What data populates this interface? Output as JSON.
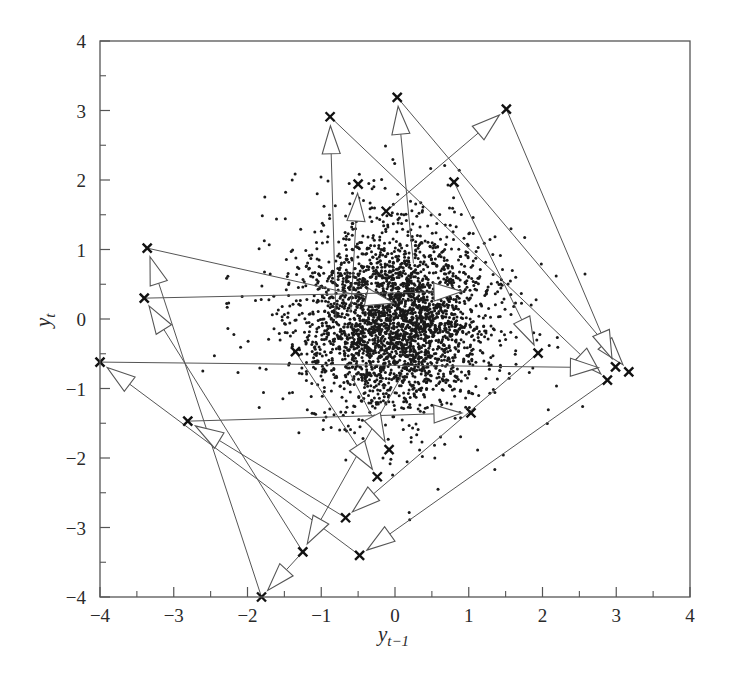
{
  "chart_data": {
    "type": "scatter",
    "title": "",
    "xlabel": "y_{t-1}",
    "ylabel": "y_t",
    "xlim": [
      -4,
      4
    ],
    "ylim": [
      -4,
      4
    ],
    "xticks": [
      -4,
      -3,
      -2,
      -1,
      0,
      1,
      2,
      3,
      4
    ],
    "yticks": [
      -4,
      -3,
      -2,
      -1,
      0,
      1,
      2,
      3,
      4
    ],
    "xtick_labels": [
      "−4",
      "−3",
      "−2",
      "−1",
      "0",
      "1",
      "2",
      "3",
      "4"
    ],
    "ytick_labels": [
      "−4",
      "−3",
      "−2",
      "−1",
      "0",
      "1",
      "2",
      "3",
      "4"
    ],
    "grid": false,
    "legend": null,
    "series": [
      {
        "name": "lag scatter (dense cloud)",
        "marker": "dot",
        "color": "#1a1a1a",
        "description": "Several thousand points concentrated near (0,0) with spread roughly SD 0.6, sparse outliers up to about |2.5|",
        "center": [
          0.0,
          0.0
        ],
        "spread_sd": 0.6,
        "approx_count": 3000
      },
      {
        "name": "outlier points",
        "marker": "x",
        "color": "#1a1a1a",
        "points": [
          [
            -0.88,
            2.91
          ],
          [
            0.03,
            3.19
          ],
          [
            1.51,
            3.02
          ],
          [
            -0.5,
            1.94
          ],
          [
            0.8,
            1.97
          ],
          [
            -0.12,
            1.55
          ],
          [
            -3.36,
            1.02
          ],
          [
            -3.4,
            0.3
          ],
          [
            -4.0,
            -0.62
          ],
          [
            -2.81,
            -1.47
          ],
          [
            -1.81,
            -4.0
          ],
          [
            -1.25,
            -3.35
          ],
          [
            -0.67,
            -2.86
          ],
          [
            -0.48,
            -3.4
          ],
          [
            2.88,
            -0.88
          ],
          [
            2.99,
            -0.69
          ],
          [
            3.17,
            -0.76
          ],
          [
            1.94,
            -0.49
          ],
          [
            1.03,
            -1.35
          ],
          [
            -0.08,
            -1.88
          ],
          [
            -0.24,
            -2.27
          ],
          [
            -1.35,
            -0.47
          ]
        ]
      },
      {
        "name": "transition arrows",
        "marker": "hollow-arrow",
        "color": "#555555",
        "arrows": [
          {
            "from": [
              -0.12,
              1.55
            ],
            "to": [
              1.51,
              3.02
            ]
          },
          {
            "from": [
              -0.8,
              0.0
            ],
            "to": [
              -0.88,
              2.91
            ]
          },
          {
            "from": [
              0.25,
              0.8
            ],
            "to": [
              0.03,
              3.19
            ]
          },
          {
            "from": [
              -0.6,
              0.1
            ],
            "to": [
              -0.5,
              1.94
            ]
          },
          {
            "from": [
              -0.88,
              2.91
            ],
            "to": [
              2.88,
              -0.88
            ]
          },
          {
            "from": [
              0.03,
              3.19
            ],
            "to": [
              3.17,
              -0.76
            ]
          },
          {
            "from": [
              1.51,
              3.02
            ],
            "to": [
              2.99,
              -0.69
            ]
          },
          {
            "from": [
              0.8,
              1.97
            ],
            "to": [
              1.94,
              -0.49
            ]
          },
          {
            "from": [
              -3.36,
              1.02
            ],
            "to": [
              0.1,
              0.2
            ]
          },
          {
            "from": [
              -3.4,
              0.3
            ],
            "to": [
              1.03,
              0.4
            ]
          },
          {
            "from": [
              -4.0,
              -0.62
            ],
            "to": [
              2.88,
              -0.7
            ]
          },
          {
            "from": [
              -1.81,
              -4.0
            ],
            "to": [
              -3.36,
              1.02
            ]
          },
          {
            "from": [
              -1.25,
              -3.35
            ],
            "to": [
              -3.4,
              0.3
            ]
          },
          {
            "from": [
              -0.48,
              -3.4
            ],
            "to": [
              -4.0,
              -0.62
            ]
          },
          {
            "from": [
              -0.67,
              -2.86
            ],
            "to": [
              -2.81,
              -1.47
            ]
          },
          {
            "from": [
              -1.25,
              -3.35
            ],
            "to": [
              -1.81,
              -4.0
            ]
          },
          {
            "from": [
              0.1,
              -0.8
            ],
            "to": [
              -1.25,
              -3.35
            ]
          },
          {
            "from": [
              1.94,
              -0.49
            ],
            "to": [
              -0.67,
              -2.86
            ]
          },
          {
            "from": [
              2.88,
              -0.88
            ],
            "to": [
              -0.48,
              -3.4
            ]
          },
          {
            "from": [
              -2.81,
              -1.47
            ],
            "to": [
              1.03,
              -1.35
            ]
          },
          {
            "from": [
              -1.35,
              -0.47
            ],
            "to": [
              -0.24,
              -2.27
            ]
          },
          {
            "from": [
              -0.6,
              -0.8
            ],
            "to": [
              -0.08,
              -1.88
            ]
          }
        ]
      }
    ]
  },
  "axes": {
    "x_label_main": "y",
    "x_label_sub": "t−1",
    "y_label_main": "y",
    "y_label_sub": "t"
  },
  "colors": {
    "axis": "#555555",
    "points": "#1a1a1a",
    "arrow": "#555555",
    "background": "#ffffff"
  }
}
